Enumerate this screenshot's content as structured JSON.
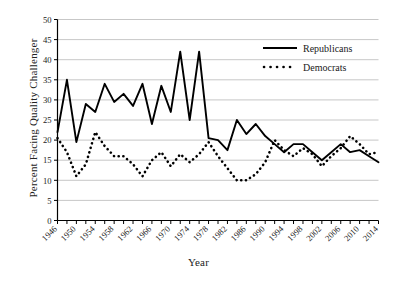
{
  "chart_data": {
    "type": "line",
    "title": "",
    "xlabel": "Year",
    "ylabel": "Percent Facing Quality Challenger",
    "xlim": [
      1946,
      2014
    ],
    "ylim": [
      0,
      50
    ],
    "ytick_step": 5,
    "xtick_step": 4,
    "grid": "horizontal",
    "legend_position": "top-right",
    "yticks": [
      "0",
      "5",
      "10",
      "15",
      "20",
      "25",
      "30",
      "35",
      "40",
      "45",
      "50"
    ],
    "xticks": [
      "1946",
      "1950",
      "1954",
      "1958",
      "1962",
      "1966",
      "1970",
      "1974",
      "1978",
      "1982",
      "1986",
      "1990",
      "1994",
      "1998",
      "2002",
      "2006",
      "2010",
      "2014"
    ],
    "x": [
      1946,
      1948,
      1950,
      1952,
      1954,
      1956,
      1958,
      1960,
      1962,
      1964,
      1966,
      1968,
      1970,
      1972,
      1974,
      1976,
      1978,
      1980,
      1982,
      1984,
      1986,
      1988,
      1990,
      1992,
      1994,
      1996,
      1998,
      2000,
      2002,
      2004,
      2006,
      2008,
      2010,
      2012,
      2014
    ],
    "series": [
      {
        "name": "Republicans",
        "style": "solid",
        "color": "#000000",
        "values": [
          22.0,
          35.0,
          19.5,
          29.0,
          27.0,
          34.0,
          29.5,
          31.5,
          28.5,
          34.0,
          24.0,
          33.5,
          27.0,
          42.0,
          25.0,
          42.0,
          20.5,
          20.0,
          17.5,
          25.0,
          21.5,
          24.0,
          21.0,
          19.0,
          17.0,
          19.0,
          19.0,
          17.0,
          15.0,
          17.0,
          19.0,
          17.0,
          17.5,
          16.0,
          14.5
        ]
      },
      {
        "name": "Democrats",
        "style": "dotted",
        "color": "#000000",
        "values": [
          20.5,
          17.0,
          11.0,
          14.0,
          22.0,
          18.5,
          16.0,
          16.0,
          14.0,
          11.0,
          15.0,
          17.0,
          13.5,
          16.5,
          14.5,
          16.5,
          19.5,
          16.0,
          13.0,
          10.0,
          10.0,
          11.5,
          14.5,
          20.0,
          17.5,
          16.0,
          18.0,
          16.5,
          13.5,
          16.0,
          18.0,
          21.0,
          19.0,
          16.5,
          17.0
        ]
      }
    ]
  },
  "legend": {
    "items": [
      {
        "label": "Republicans",
        "style": "solid"
      },
      {
        "label": "Democrats",
        "style": "dotted"
      }
    ]
  }
}
